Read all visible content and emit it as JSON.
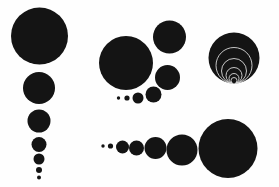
{
  "figure": {
    "background_color": "#fefefe",
    "disc_color": "#141414",
    "outline_color": "#d8d8d8",
    "width": 279,
    "height": 187
  },
  "groups": [
    {
      "name": "descending-vertical-chain",
      "label": "Left descending chain",
      "description": "Vertical chain of tangent discs decreasing in radius downward",
      "circles": [
        {
          "cx": 39.5,
          "cy": 36.0,
          "r": 28.5,
          "style": "filled"
        },
        {
          "cx": 39.0,
          "cy": 88.0,
          "r": 16.0,
          "style": "filled"
        },
        {
          "cx": 39.0,
          "cy": 121.0,
          "r": 11.5,
          "style": "filled"
        },
        {
          "cx": 39.0,
          "cy": 144.5,
          "r": 7.5,
          "style": "filled"
        },
        {
          "cx": 39.0,
          "cy": 159.0,
          "r": 5.5,
          "style": "filled"
        },
        {
          "cx": 39.0,
          "cy": 170.0,
          "r": 3.0,
          "style": "filled"
        },
        {
          "cx": 39.0,
          "cy": 177.5,
          "r": 2.0,
          "style": "filled"
        }
      ]
    },
    {
      "name": "spiral-arc-cluster",
      "label": "Middle spiral cluster",
      "description": "Large disc with a clockwise spiral of shrinking tangent discs sweeping right then down-left",
      "circles": [
        {
          "cx": 126.0,
          "cy": 63.0,
          "r": 27.0,
          "style": "filled"
        },
        {
          "cx": 169.5,
          "cy": 37.0,
          "r": 16.5,
          "style": "filled"
        },
        {
          "cx": 167.5,
          "cy": 77.5,
          "r": 12.5,
          "style": "filled"
        },
        {
          "cx": 153.5,
          "cy": 94.5,
          "r": 8.0,
          "style": "filled"
        },
        {
          "cx": 138.0,
          "cy": 98.0,
          "r": 5.5,
          "style": "filled"
        },
        {
          "cx": 127.0,
          "cy": 98.0,
          "r": 2.6,
          "style": "filled"
        },
        {
          "cx": 118.5,
          "cy": 98.0,
          "r": 1.7,
          "style": "filled"
        }
      ]
    },
    {
      "name": "nested-tangent-family",
      "label": "Right nested tangent family",
      "description": "Filled disc containing concentric outlined circles internally tangent at the bottom point",
      "circles": [
        {
          "cx": 234.0,
          "cy": 58.0,
          "r": 25.5,
          "style": "filled"
        },
        {
          "cx": 234.0,
          "cy": 65.5,
          "r": 18.0,
          "style": "outline"
        },
        {
          "cx": 234.0,
          "cy": 71.0,
          "r": 12.5,
          "style": "outline"
        },
        {
          "cx": 234.0,
          "cy": 75.5,
          "r": 8.0,
          "style": "outline"
        },
        {
          "cx": 234.0,
          "cy": 78.5,
          "r": 5.0,
          "style": "outline"
        },
        {
          "cx": 234.0,
          "cy": 80.5,
          "r": 3.0,
          "style": "outline"
        },
        {
          "cx": 234.0,
          "cy": 81.7,
          "r": 1.8,
          "style": "filled"
        }
      ]
    },
    {
      "name": "ascending-horizontal-row",
      "label": "Bottom ascending row",
      "description": "Horizontal row of tangent discs increasing in radius to the right",
      "circles": [
        {
          "cx": 103.0,
          "cy": 146.0,
          "r": 1.7,
          "style": "filled"
        },
        {
          "cx": 110.5,
          "cy": 146.0,
          "r": 2.6,
          "style": "filled"
        },
        {
          "cx": 122.5,
          "cy": 147.0,
          "r": 6.5,
          "style": "filled"
        },
        {
          "cx": 136.5,
          "cy": 148.0,
          "r": 7.5,
          "style": "filled"
        },
        {
          "cx": 155.5,
          "cy": 148.0,
          "r": 11.0,
          "style": "filled"
        },
        {
          "cx": 182.0,
          "cy": 150.0,
          "r": 15.5,
          "style": "filled"
        },
        {
          "cx": 228.0,
          "cy": 148.5,
          "r": 29.5,
          "style": "filled"
        }
      ]
    }
  ]
}
